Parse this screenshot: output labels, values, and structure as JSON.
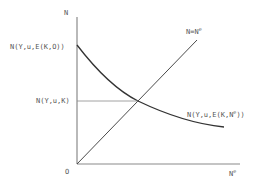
{
  "diagram": {
    "y_axis_label": "N",
    "x_axis_label_base": "N",
    "x_axis_label_sup": "e",
    "origin_label": "O",
    "line_label_base": "N=N",
    "line_label_sup": "e",
    "curve_start_label": "N(Y,u,E(K,O))",
    "equilibrium_label": "N(Y,u,K)",
    "curve_end_label_base": "N(Y,u,E(K,N",
    "curve_end_label_sup": "e",
    "curve_end_label_tail": "))",
    "elements": [
      {
        "id": "y-axis",
        "kind": "axis"
      },
      {
        "id": "x-axis",
        "kind": "axis"
      },
      {
        "id": "forty-five-line",
        "kind": "line",
        "relation": "N = N^e"
      },
      {
        "id": "demand-curve",
        "kind": "curve",
        "relation": "N(Y,u,E(K,N^e)), downward sloping"
      },
      {
        "id": "equilibrium-guide",
        "kind": "guide",
        "relation": "horizontal line at N(Y,u,K) to intersection"
      }
    ]
  }
}
